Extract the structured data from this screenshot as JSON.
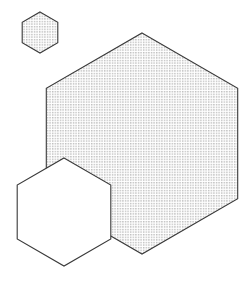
{
  "canvas": {
    "width": 247,
    "height": 281,
    "background_color": "#ffffff",
    "title": "Hexagons"
  },
  "style": {
    "stroke_color": "#3a3a3a",
    "stroke_width": 1.1,
    "stipple_dot_color": "#4a4a4a",
    "stipple_spacing": 2.6,
    "stipple_dot_size": 0.85,
    "fill_white": "#ffffff"
  },
  "shapes": [
    {
      "id": "hexagon-small",
      "name": "small-stippled-hexagon",
      "orientation": "pointy-top",
      "center_x": 40,
      "center_y": 32.5,
      "radius": 20.5,
      "fill": "stipple",
      "fill_color": "#ffffff",
      "stroke_color": "#3a3a3a",
      "z_order": 1,
      "vertices": [
        [
          40,
          12
        ],
        [
          57.8,
          22.25
        ],
        [
          57.8,
          42.75
        ],
        [
          40,
          53
        ],
        [
          22.2,
          42.75
        ],
        [
          22.2,
          22.25
        ]
      ]
    },
    {
      "id": "hexagon-large",
      "name": "large-stippled-hexagon",
      "orientation": "pointy-top",
      "center_x": 142,
      "center_y": 143.5,
      "radius": 110.5,
      "fill": "stipple",
      "fill_color": "#ffffff",
      "stroke_color": "#3a3a3a",
      "z_order": 2,
      "vertices": [
        [
          142,
          33
        ],
        [
          237.7,
          88.25
        ],
        [
          237.7,
          198.75
        ],
        [
          142,
          254
        ],
        [
          46.3,
          198.75
        ],
        [
          46.3,
          88.25
        ]
      ]
    },
    {
      "id": "hexagon-white",
      "name": "white-overlapping-hexagon",
      "orientation": "pointy-top",
      "center_x": 64,
      "center_y": 212,
      "radius": 54,
      "fill": "solid",
      "fill_color": "#ffffff",
      "stroke_color": "#3a3a3a",
      "z_order": 3,
      "vertices": [
        [
          64,
          158
        ],
        [
          110.8,
          185
        ],
        [
          110.8,
          239
        ],
        [
          64,
          266
        ],
        [
          17.2,
          239
        ],
        [
          17.2,
          185
        ]
      ]
    }
  ],
  "chart_data": {
    "type": "scatter",
    "shape_count": 3,
    "shape_kind": "regular hexagon",
    "orientation": "pointy-top",
    "xlabel": "",
    "ylabel": "",
    "xlim": [
      0,
      247
    ],
    "ylim": [
      0,
      281
    ],
    "grid": false,
    "legend": "none",
    "annotations": [],
    "categories": [
      "hexagon-small",
      "hexagon-large",
      "hexagon-white"
    ],
    "values": [
      20.5,
      110.5,
      54
    ],
    "series": [
      {
        "name": "center_x",
        "values": [
          40,
          142,
          64
        ]
      },
      {
        "name": "center_y",
        "values": [
          32.5,
          143.5,
          212
        ]
      },
      {
        "name": "circumradius",
        "values": [
          20.5,
          110.5,
          54
        ]
      }
    ]
  }
}
